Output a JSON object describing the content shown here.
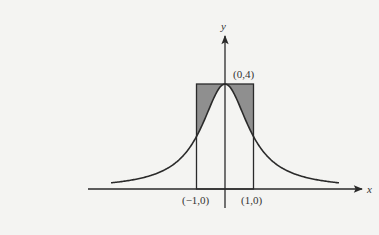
{
  "diagram": {
    "function": "y = 4/(1+x^2)",
    "peak_point": {
      "x": 0,
      "y": 4
    },
    "rectangle": {
      "x_from": -1,
      "x_to": 1,
      "y_from": 0,
      "y_to": 4
    },
    "shaded_region": "area inside rectangle above curve",
    "curve_x_range": [
      -4,
      4
    ],
    "labels": {
      "x_axis": "x",
      "y_axis": "y",
      "peak": "(0,4)",
      "left_point": "(−1,0)",
      "right_point": "(1,0)"
    },
    "colors": {
      "ink": "#2a2a2a",
      "shade": "#8f8f8f",
      "background": "#f4f4f2"
    }
  }
}
